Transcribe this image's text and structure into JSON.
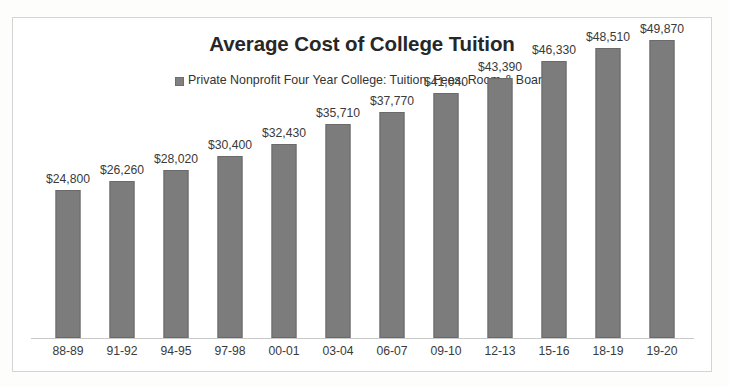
{
  "chart_data": {
    "type": "bar",
    "title": "Average Cost of College Tuition",
    "xlabel": "",
    "ylabel": "",
    "grid": false,
    "legend_position": "top-center",
    "axis_visible": {
      "x_baseline": true,
      "y_axis": false,
      "y_ticks": false
    },
    "ylim": [
      0,
      53500
    ],
    "categories": [
      "88-89",
      "91-92",
      "94-95",
      "97-98",
      "00-01",
      "03-04",
      "06-07",
      "09-10",
      "12-13",
      "15-16",
      "18-19",
      "19-20"
    ],
    "series": [
      {
        "name": "Private Nonprofit Four Year College: Tuition, Fees, Room & Board",
        "color": "#7c7c7c",
        "values": [
          24800,
          26260,
          28020,
          30400,
          32430,
          35710,
          37770,
          41040,
          43390,
          46330,
          48510,
          49870
        ],
        "data_labels": [
          "$24,800",
          "$26,260",
          "$28,020",
          "$30,400",
          "$32,430",
          "$35,710",
          "$37,770",
          "$41,040",
          "$43,390",
          "$46,330",
          "$48,510",
          "$49,870"
        ]
      }
    ]
  },
  "legend": {
    "entries": [
      {
        "label": "Private Nonprofit Four Year College: Tuition, Fees, Room & Board",
        "color": "#7c7c7c"
      }
    ]
  },
  "colors": {
    "bar_fill": "#7c7c7c",
    "bar_border": "#6a6a6a",
    "title_text": "#272727",
    "label_text": "#3a3a3a",
    "frame_border": "#d4d4d4",
    "axis_line": "#c9c9c9",
    "background": "#ffffff"
  }
}
